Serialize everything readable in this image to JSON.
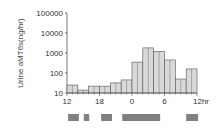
{
  "chart_data": {
    "type": "bar",
    "title": "",
    "xlabel": "",
    "ylabel": "Urine aMT6s(ng/hr)",
    "yscale": "log",
    "ylim": [
      10,
      100000
    ],
    "yticks": [
      "10",
      "100",
      "1000",
      "10000",
      "100000"
    ],
    "xticks": [
      "12",
      "18",
      "0",
      "6",
      "12hr"
    ],
    "categories": [
      "12-14",
      "14-16",
      "16-18",
      "18-20",
      "20-22",
      "22-0",
      "0-2",
      "2-4",
      "4-6",
      "6-8",
      "8-10",
      "10-12"
    ],
    "values": [
      25,
      14,
      22,
      22,
      32,
      45,
      350,
      1800,
      1200,
      450,
      50,
      160
    ],
    "grid": false,
    "legend": null,
    "bar_fill": "#d9d9d9",
    "bar_edge": "#555555",
    "dark_periods": [
      {
        "start_hr": 12.2,
        "end_hr": 14.2
      },
      {
        "start_hr": 15.1,
        "end_hr": 16.1
      },
      {
        "start_hr": 18.3,
        "end_hr": 20.3
      },
      {
        "start_hr": 22.2,
        "end_hr": 29.2
      },
      {
        "start_hr": 34.0,
        "end_hr": 36.2
      }
    ],
    "dark_period_color": "#808080"
  }
}
